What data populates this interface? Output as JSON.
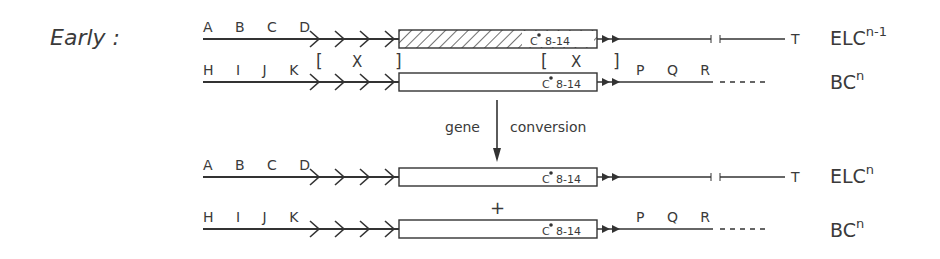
{
  "title": "Early :",
  "conversion_label": {
    "left": "gene",
    "right": "conversion"
  },
  "plus": "+",
  "bracket_mark": "X",
  "gene_label": "C",
  "gene_range": "8-14",
  "rows": [
    {
      "letters": [
        "A",
        "B",
        "C",
        "D"
      ],
      "right_letters": [],
      "tail": "T",
      "name": "ELC",
      "sup": "n-1",
      "hatched": true
    },
    {
      "letters": [
        "H",
        "I",
        "J",
        "K"
      ],
      "right_letters": [
        "P",
        "Q",
        "R"
      ],
      "tail": "",
      "name": "BC",
      "sup": "n",
      "hatched": false
    },
    {
      "letters": [
        "A",
        "B",
        "C",
        "D"
      ],
      "right_letters": [],
      "tail": "T",
      "name": "ELC",
      "sup": "n",
      "hatched": false
    },
    {
      "letters": [
        "H",
        "I",
        "J",
        "K"
      ],
      "right_letters": [
        "P",
        "Q",
        "R"
      ],
      "tail": "",
      "name": "BC",
      "sup": "n",
      "hatched": false
    }
  ]
}
